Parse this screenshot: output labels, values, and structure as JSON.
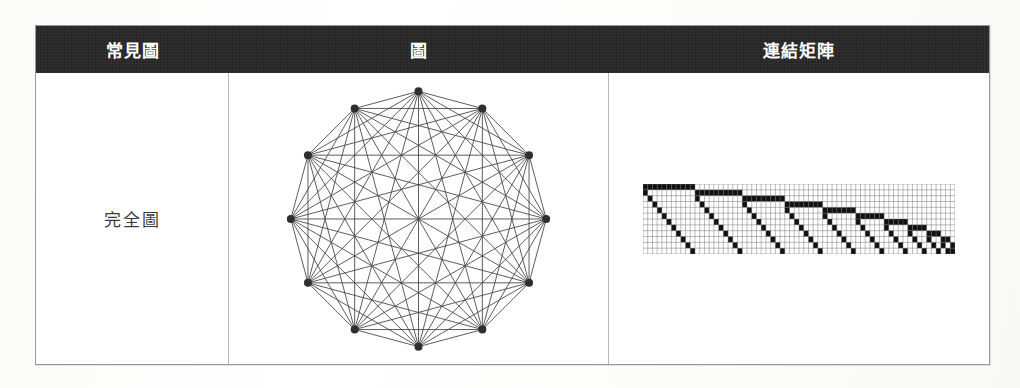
{
  "table": {
    "headers": [
      {
        "label": "常見圖",
        "name": "common-graph"
      },
      {
        "label": "圖",
        "name": "graph"
      },
      {
        "label": "連結矩陣",
        "name": "adjacency-matrix"
      }
    ],
    "rows": [
      {
        "label": "完全圖",
        "name": "complete-graph"
      }
    ]
  },
  "colors": {
    "header_bg": "#262626",
    "header_text": "#ffffff",
    "border": "#9a9a9a",
    "inner_border": "#b8b8b8",
    "graph_stroke": "#4a4a4a",
    "graph_vertex": "#2e2e2e",
    "matrix_on": "#111111",
    "matrix_off": "#ffffff",
    "matrix_grid": "#6a6a6a",
    "page_bg": "#fdfdfc",
    "label_text": "#3a3a3a"
  },
  "chart_data": {
    "type": "diagram",
    "title": "完全圖",
    "graph": {
      "kind": "complete-graph",
      "notation": "K12",
      "vertex_count": 12,
      "edge_count": 66,
      "layout": "circular",
      "center": [
        190,
        146
      ],
      "radius": 128,
      "vertex_radius": 4,
      "start_angle_deg": -90,
      "directed": false,
      "vertices": [
        {
          "id": 0,
          "angle_deg": -90
        },
        {
          "id": 1,
          "angle_deg": -60
        },
        {
          "id": 2,
          "angle_deg": -30
        },
        {
          "id": 3,
          "angle_deg": 0
        },
        {
          "id": 4,
          "angle_deg": 30
        },
        {
          "id": 5,
          "angle_deg": 60
        },
        {
          "id": 6,
          "angle_deg": 90
        },
        {
          "id": 7,
          "angle_deg": 120
        },
        {
          "id": 8,
          "angle_deg": 150
        },
        {
          "id": 9,
          "angle_deg": 180
        },
        {
          "id": 10,
          "angle_deg": 210
        },
        {
          "id": 11,
          "angle_deg": 240
        }
      ]
    },
    "matrix": {
      "kind": "triangular-adjacency-strip",
      "rows": 12,
      "cols": 66,
      "cell_px": 4.7,
      "description": "Upper-triangular adjacency of K12 unrolled: 11 descending staircase blocks of widths 11,10,9,8,7,6,5,4,3,2,1",
      "block_widths": [
        11,
        10,
        9,
        8,
        7,
        6,
        5,
        4,
        3,
        2,
        1
      ],
      "all_pairs_connected": true
    }
  }
}
